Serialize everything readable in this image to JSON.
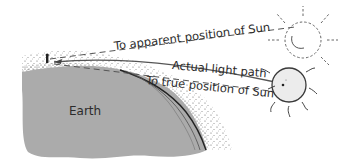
{
  "diagram": {
    "type": "atmospheric-refraction",
    "labels": {
      "apparent_sun": "To apparent position of Sun",
      "light_path": "Actual light path",
      "true_sun": "To true position of Sun",
      "earth": "Earth"
    },
    "colors": {
      "earth_fill": "#ababab",
      "atmosphere_dots": "#555555",
      "line": "#444444",
      "sun_fill": "#ececec",
      "sun_outline": "#3a3a3a",
      "apparent_sun_outline": "#555555"
    }
  }
}
